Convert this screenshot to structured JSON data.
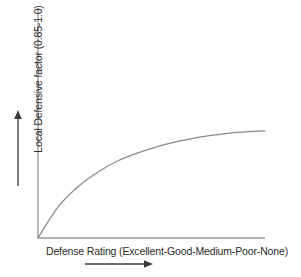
{
  "chart_data": {
    "type": "line",
    "title": "",
    "subtitle": "",
    "xlabel": "Defense Rating (Excellent-Good-Medium-Poor-None)",
    "ylabel": "Local Defensive factor (0.85-1.0)",
    "ylim": [
      0.85,
      1.0
    ],
    "xlim": [
      0,
      1
    ],
    "grid": false,
    "legend": null,
    "axis_ticks": {
      "x": [],
      "y": []
    },
    "x_categories": [
      "Excellent",
      "Good",
      "Medium",
      "Poor",
      "None"
    ],
    "series": [
      {
        "name": "Local Defensive factor",
        "x": [
          0.0,
          0.09,
          0.18,
          0.27,
          0.35,
          0.44,
          0.53,
          0.62,
          0.7,
          0.79,
          0.88,
          1.0
        ],
        "values": [
          0.85,
          0.893,
          0.921,
          0.941,
          0.955,
          0.966,
          0.975,
          0.982,
          0.987,
          0.991,
          0.994,
          0.996
        ],
        "color": "#8a8a8a"
      }
    ],
    "annotations": [
      {
        "name": "y-direction-arrow",
        "label": "",
        "direction": "up",
        "description": "Upward arrow alongside the vertical axis label indicating increasing local defensive factor"
      },
      {
        "name": "x-direction-arrow",
        "label": "",
        "direction": "right",
        "description": "Rightward arrow beneath the horizontal axis label indicating worsening defense rating"
      }
    ],
    "colors": {
      "curve": "#8a8a8a",
      "axis": "#9a9a9a",
      "arrow": "#3a3a3a",
      "text": "#2b2b2b",
      "background": "#ffffff"
    }
  }
}
